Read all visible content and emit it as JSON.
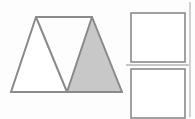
{
  "figure": {
    "width": 195,
    "height": 119,
    "background_color": "#fdfdfd",
    "stroke_color": "#8a8a8a",
    "shaded_fill_color": "#c8c8c8",
    "unshaded_fill_color": "#ffffff",
    "divider_color": "#b4b4b4",
    "shapes": {
      "triangle_pair": {
        "name": "two-adjacent-triangles",
        "left_triangle": {
          "label": "left-triangle-unshaded",
          "shaded": false,
          "points": "11,92 36,17 67,92"
        },
        "right_triangle": {
          "label": "right-triangle-shaded",
          "shaded": true,
          "points": "67,92 92,17 122,92"
        },
        "apex_connector": {
          "label": "apex-connector-line",
          "x1": 36,
          "y1": 17,
          "x2": 92,
          "y2": 17
        },
        "base_line": {
          "label": "shared-base-line",
          "x1": 11,
          "y1": 92,
          "x2": 122,
          "y2": 92
        }
      },
      "square_top": {
        "label": "top-square",
        "x": 131,
        "y": 13,
        "width": 54,
        "height": 49,
        "shaded": false
      },
      "square_bottom": {
        "label": "bottom-square",
        "x": 131,
        "y": 69,
        "width": 54,
        "height": 49,
        "shaded": false
      },
      "horizontal_divider": {
        "label": "horizontal-divider-line",
        "x1": 126,
        "y1": 65,
        "x2": 189,
        "y2": 65
      },
      "vertical_rule": {
        "label": "right-vertical-rule",
        "x1": 190,
        "y1": 2,
        "x2": 190,
        "y2": 117
      }
    }
  }
}
